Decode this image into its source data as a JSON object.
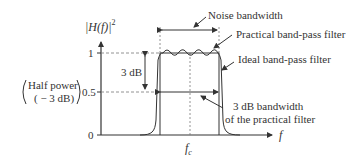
{
  "diagram": {
    "y_axis_label": "|H(f)|",
    "y_axis_label_exp": "2",
    "x_axis_label": "f",
    "center_freq_label": "f",
    "center_freq_sub": "c",
    "y_ticks": [
      {
        "label": "1",
        "value": 1
      },
      {
        "label": "0.5",
        "value": 0.5
      },
      {
        "label": "0",
        "value": 0
      }
    ],
    "half_power_line1": "Half power",
    "half_power_line2": "( − 3 dB)",
    "three_db_label": "3 dB",
    "annotations": {
      "noise_bandwidth": "Noise bandwidth",
      "practical_filter": "Practical band-pass filter",
      "ideal_filter": "Ideal band-pass filter",
      "three_db_bw_line1": "3 dB bandwidth",
      "three_db_bw_line2": "of the practical filter"
    },
    "colors": {
      "line": "#333333",
      "dashed": "#777777"
    }
  }
}
